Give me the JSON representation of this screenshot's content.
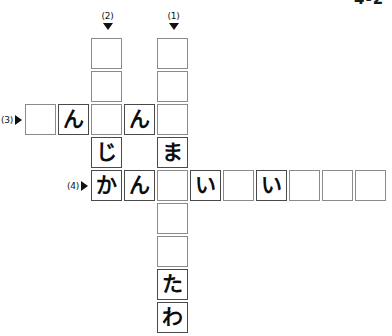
{
  "puzzle": {
    "type": "japanese-kana-crossword",
    "corner_mark": "4-2",
    "grid": {
      "cell_size": 33,
      "origin_x": 25,
      "origin_y": 38,
      "columns": 11,
      "rows": 9
    },
    "clue_markers": [
      {
        "id": "clue-2-down",
        "label": "(2)",
        "direction": "down",
        "arrow": "triangle-down-icon",
        "col": 2,
        "row": 0
      },
      {
        "id": "clue-1-down",
        "label": "(1)",
        "direction": "down",
        "arrow": "triangle-down-icon",
        "col": 4,
        "row": 0
      },
      {
        "id": "clue-3-across",
        "label": "(3)",
        "direction": "across",
        "arrow": "triangle-right-icon",
        "col": 0,
        "row": 2
      },
      {
        "id": "clue-4-across",
        "label": "(4)",
        "direction": "across",
        "arrow": "triangle-right-icon",
        "col": 2,
        "row": 4
      }
    ],
    "cells": [
      {
        "col": 2,
        "row": 0,
        "value": ""
      },
      {
        "col": 4,
        "row": 0,
        "value": ""
      },
      {
        "col": 2,
        "row": 1,
        "value": ""
      },
      {
        "col": 4,
        "row": 1,
        "value": ""
      },
      {
        "col": 0,
        "row": 2,
        "value": ""
      },
      {
        "col": 1,
        "row": 2,
        "value": "ん"
      },
      {
        "col": 2,
        "row": 2,
        "value": ""
      },
      {
        "col": 3,
        "row": 2,
        "value": "ん"
      },
      {
        "col": 4,
        "row": 2,
        "value": ""
      },
      {
        "col": 2,
        "row": 3,
        "value": "じ"
      },
      {
        "col": 4,
        "row": 3,
        "value": "ま"
      },
      {
        "col": 2,
        "row": 4,
        "value": "か"
      },
      {
        "col": 3,
        "row": 4,
        "value": "ん"
      },
      {
        "col": 4,
        "row": 4,
        "value": ""
      },
      {
        "col": 5,
        "row": 4,
        "value": "い"
      },
      {
        "col": 6,
        "row": 4,
        "value": ""
      },
      {
        "col": 7,
        "row": 4,
        "value": "い"
      },
      {
        "col": 8,
        "row": 4,
        "value": ""
      },
      {
        "col": 9,
        "row": 4,
        "value": ""
      },
      {
        "col": 10,
        "row": 4,
        "value": ""
      },
      {
        "col": 4,
        "row": 5,
        "value": ""
      },
      {
        "col": 4,
        "row": 6,
        "value": ""
      },
      {
        "col": 4,
        "row": 7,
        "value": "た"
      },
      {
        "col": 4,
        "row": 8,
        "value": "わ"
      }
    ],
    "answers": {
      "clue_2_down": [
        "",
        "",
        "",
        "じ",
        "か"
      ],
      "clue_1_down": [
        "",
        "",
        "",
        "ま",
        "",
        "",
        "",
        "た",
        "わ"
      ],
      "clue_3_across": [
        "",
        "ん",
        "",
        "ん",
        ""
      ],
      "clue_4_across": [
        "か",
        "ん",
        "",
        "い",
        "",
        "い",
        "",
        "",
        ""
      ]
    }
  },
  "colors": {
    "cell_border": "#8a8a8a",
    "cell_border_filled": "#4a4a4a",
    "text": "#0d0d0d",
    "background": "#ffffff",
    "marker": "#111111"
  }
}
